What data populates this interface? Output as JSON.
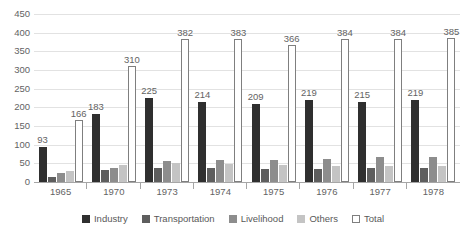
{
  "chart_data": {
    "type": "bar",
    "title": "",
    "xlabel": "",
    "ylabel": "",
    "grid": true,
    "legend_position": "bottom",
    "ylim": [
      0,
      450
    ],
    "ytick_step": 50,
    "yticks": [
      "450",
      "400",
      "350",
      "300",
      "250",
      "200",
      "150",
      "100",
      "50",
      "0"
    ],
    "categories": [
      "1965",
      "1970",
      "1973",
      "1974",
      "1975",
      "1976",
      "1977",
      "1978"
    ],
    "series": [
      {
        "name": "Industry",
        "color": "#2f2f2f",
        "values": [
          93,
          183,
          225,
          214,
          209,
          219,
          215,
          219
        ],
        "labels": [
          "93",
          "183",
          "225",
          "214",
          "209",
          "219",
          "215",
          "219"
        ],
        "show_labels": true
      },
      {
        "name": "Transportation",
        "color": "#5e5e5e",
        "values": [
          13,
          33,
          37,
          38,
          36,
          36,
          38,
          38
        ],
        "labels": [
          "",
          "",
          "",
          "",
          "",
          "",
          "",
          ""
        ],
        "show_labels": false
      },
      {
        "name": "Livelihood",
        "color": "#8d8d8d",
        "values": [
          25,
          38,
          55,
          58,
          60,
          62,
          66,
          68
        ],
        "labels": [
          "",
          "",
          "",
          "",
          "",
          "",
          "",
          ""
        ],
        "show_labels": false
      },
      {
        "name": "Others",
        "color": "#c4c4c4",
        "values": [
          30,
          45,
          50,
          48,
          45,
          44,
          42,
          43
        ],
        "labels": [
          "",
          "",
          "",
          "",
          "",
          "",
          "",
          ""
        ],
        "show_labels": false
      },
      {
        "name": "Total",
        "color": "#ffffff",
        "values": [
          166,
          310,
          382,
          383,
          366,
          384,
          384,
          385
        ],
        "labels": [
          "166",
          "310",
          "382",
          "383",
          "366",
          "384",
          "384",
          "385"
        ],
        "show_labels": true
      }
    ]
  },
  "legend": {
    "items": [
      {
        "label": "Industry",
        "key": "industry"
      },
      {
        "label": "Transportation",
        "key": "transportation"
      },
      {
        "label": "Livelihood",
        "key": "livelihood"
      },
      {
        "label": "Others",
        "key": "others"
      },
      {
        "label": "Total",
        "key": "total"
      }
    ]
  }
}
